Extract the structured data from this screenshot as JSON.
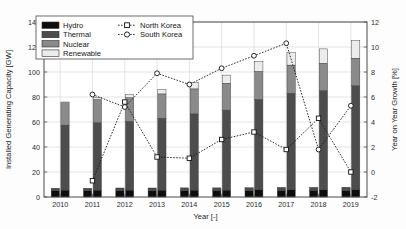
{
  "figure": {
    "background": "#ffffff",
    "frame_color": "#4a4a4a"
  },
  "chart_data": {
    "type": "bar",
    "title": "",
    "xlabel": "Year [-]",
    "ylabel": "Installed Generating Capacity [GW]",
    "y2label": "Year on Year Growth [%]",
    "categories": [
      "2010",
      "2011",
      "2012",
      "2013",
      "2014",
      "2015",
      "2016",
      "2017",
      "2018",
      "2019"
    ],
    "ylim": [
      0,
      140
    ],
    "yticks": [
      0,
      20,
      40,
      60,
      80,
      100,
      120,
      140
    ],
    "y2lim": [
      -2,
      12
    ],
    "y2ticks": [
      -2,
      0,
      2,
      4,
      6,
      8,
      10,
      12
    ],
    "grid": true,
    "legend_position": "upper-left",
    "bar_groups": [
      {
        "name": "North Korea",
        "note": "left bar of each year pair",
        "stacks": [
          {
            "Hydro": 5.0,
            "Thermal": 2.0,
            "Nuclear": 0.0,
            "Renewable": 0.0
          },
          {
            "Hydro": 5.0,
            "Thermal": 2.0,
            "Nuclear": 0.0,
            "Renewable": 0.0
          },
          {
            "Hydro": 5.0,
            "Thermal": 2.2,
            "Nuclear": 0.0,
            "Renewable": 0.0
          },
          {
            "Hydro": 5.0,
            "Thermal": 2.2,
            "Nuclear": 0.0,
            "Renewable": 0.0
          },
          {
            "Hydro": 5.0,
            "Thermal": 2.3,
            "Nuclear": 0.0,
            "Renewable": 0.0
          },
          {
            "Hydro": 5.0,
            "Thermal": 2.3,
            "Nuclear": 0.0,
            "Renewable": 0.0
          },
          {
            "Hydro": 5.0,
            "Thermal": 2.4,
            "Nuclear": 0.0,
            "Renewable": 0.0
          },
          {
            "Hydro": 5.2,
            "Thermal": 2.5,
            "Nuclear": 0.0,
            "Renewable": 0.0
          },
          {
            "Hydro": 5.2,
            "Thermal": 2.5,
            "Nuclear": 0.0,
            "Renewable": 0.0
          },
          {
            "Hydro": 5.2,
            "Thermal": 2.6,
            "Nuclear": 0.0,
            "Renewable": 0.0
          }
        ]
      },
      {
        "name": "South Korea",
        "note": "right bar of each year pair",
        "stacks": [
          {
            "Hydro": 5.5,
            "Thermal": 52.0,
            "Nuclear": 18.0,
            "Renewable": 0.5
          },
          {
            "Hydro": 5.5,
            "Thermal": 54.0,
            "Nuclear": 18.5,
            "Renewable": 1.5
          },
          {
            "Hydro": 5.5,
            "Thermal": 55.0,
            "Nuclear": 19.0,
            "Renewable": 2.5
          },
          {
            "Hydro": 5.5,
            "Thermal": 57.5,
            "Nuclear": 19.5,
            "Renewable": 3.5
          },
          {
            "Hydro": 5.5,
            "Thermal": 61.0,
            "Nuclear": 20.0,
            "Renewable": 5.0
          },
          {
            "Hydro": 5.5,
            "Thermal": 64.0,
            "Nuclear": 21.5,
            "Renewable": 6.5
          },
          {
            "Hydro": 6.0,
            "Thermal": 72.0,
            "Nuclear": 22.5,
            "Renewable": 8.0
          },
          {
            "Hydro": 6.0,
            "Thermal": 77.0,
            "Nuclear": 22.5,
            "Renewable": 10.0
          },
          {
            "Hydro": 6.0,
            "Thermal": 79.0,
            "Nuclear": 22.0,
            "Renewable": 11.5
          },
          {
            "Hydro": 6.0,
            "Thermal": 83.0,
            "Nuclear": 22.0,
            "Renewable": 14.0
          }
        ]
      }
    ],
    "stack_order": [
      "Hydro",
      "Thermal",
      "Nuclear",
      "Renewable"
    ],
    "stack_colors": {
      "Hydro": "#0d0d0d",
      "Thermal": "#4d4d4d",
      "Nuclear": "#8a8a8a",
      "Renewable": "#ececec"
    },
    "line_series": [
      {
        "name": "North Korea",
        "marker": "square",
        "axis": "right",
        "x": [
          "2011",
          "2012",
          "2013",
          "2014",
          "2015",
          "2016",
          "2017",
          "2018",
          "2019"
        ],
        "values": [
          -0.7,
          5.6,
          1.2,
          1.1,
          2.6,
          3.2,
          1.8,
          4.3,
          0.0
        ]
      },
      {
        "name": "South Korea",
        "marker": "circle",
        "axis": "right",
        "x": [
          "2011",
          "2012",
          "2013",
          "2014",
          "2015",
          "2016",
          "2017",
          "2018",
          "2019"
        ],
        "values": [
          6.2,
          5.2,
          7.9,
          7.0,
          8.3,
          9.3,
          10.3,
          1.8,
          5.3
        ]
      }
    ]
  },
  "legend": {
    "patch_entries": [
      {
        "label": "Hydro",
        "color": "#0d0d0d"
      },
      {
        "label": "Thermal",
        "color": "#4d4d4d"
      },
      {
        "label": "Nuclear",
        "color": "#8a8a8a"
      },
      {
        "label": "Renewable",
        "color": "#ececec"
      }
    ],
    "line_entries": [
      {
        "label": "North Korea",
        "marker": "square"
      },
      {
        "label": "South Korea",
        "marker": "circle"
      }
    ]
  }
}
